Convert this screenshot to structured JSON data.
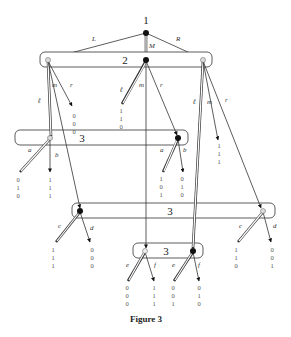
{
  "figure": {
    "caption": "Figure 3",
    "root": {
      "label": "1",
      "player": "1"
    },
    "root_moves": [
      "L",
      "M",
      "R"
    ],
    "info_sets": [
      {
        "id": "is2",
        "label": "2",
        "player": "2",
        "moves": [
          "ℓ",
          "m",
          "r"
        ]
      },
      {
        "id": "is3a",
        "label": "3",
        "player": "3",
        "moves": [
          "a",
          "b"
        ]
      },
      {
        "id": "is3b",
        "label": "3",
        "player": "3",
        "moves": [
          "c",
          "d"
        ]
      },
      {
        "id": "is3c",
        "label": "3",
        "player": "3",
        "moves": [
          "e",
          "f"
        ]
      }
    ],
    "payoffs": {
      "L_r": [
        "0",
        "0",
        "0"
      ],
      "M_l": [
        "1",
        "1",
        "0"
      ],
      "R_m": [
        "1",
        "1",
        "1"
      ],
      "L_l_a": [
        "0",
        "1",
        "0"
      ],
      "L_l_b": [
        "1",
        "1",
        "1"
      ],
      "M_r_a": [
        "1",
        "0",
        "1"
      ],
      "M_r_b": [
        "0",
        "1",
        "0"
      ],
      "L_m_c": [
        "1",
        "1",
        "1"
      ],
      "L_m_d": [
        "0",
        "0",
        "0"
      ],
      "R_r_c": [
        "1",
        "1",
        "0"
      ],
      "R_r_d": [
        "0",
        "0",
        "1"
      ],
      "M_m_e": [
        "0",
        "0",
        "0"
      ],
      "M_m_f": [
        "1",
        "1",
        "1"
      ],
      "R_l_e": [
        "0",
        "0",
        "1"
      ],
      "R_l_f": [
        "0",
        "1",
        "0"
      ]
    }
  }
}
